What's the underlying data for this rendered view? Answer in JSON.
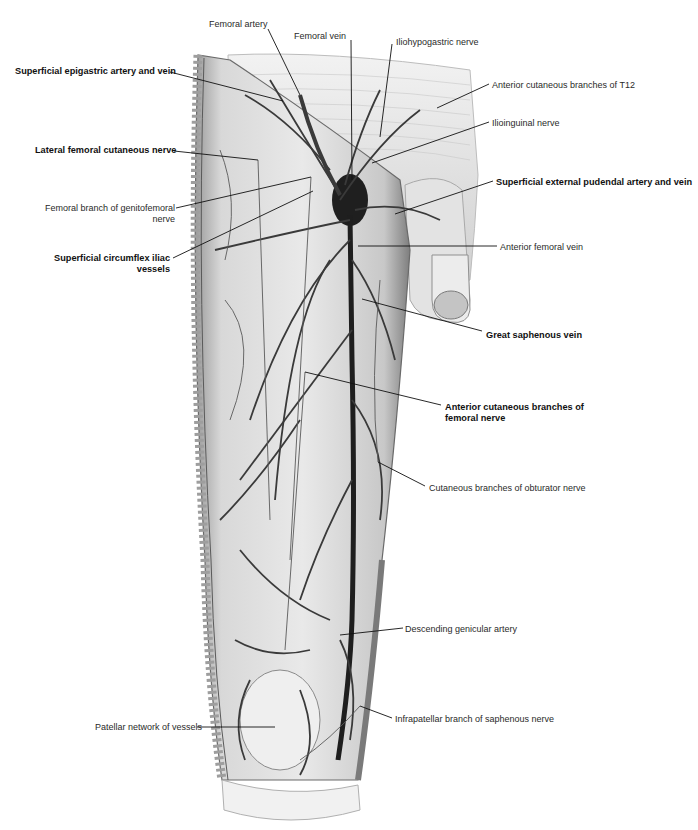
{
  "figure": {
    "colors": {
      "background": "#ffffff",
      "tissue": "#dcdcdc",
      "vessel": "#3a3a3a",
      "vein_dark": "#1e1e1e",
      "leader": "#111111"
    }
  },
  "labels": [
    {
      "id": "femoral-artery",
      "text": "Femoral artery",
      "bold": false,
      "x": 209,
      "y": 19,
      "align": "left",
      "line": [
        [
          268,
          29
        ],
        [
          300,
          95
        ]
      ]
    },
    {
      "id": "femoral-vein",
      "text": "Femoral vein",
      "bold": false,
      "x": 294,
      "y": 31,
      "align": "left",
      "line": [
        [
          351,
          40
        ],
        [
          352,
          180
        ]
      ]
    },
    {
      "id": "iliohypogastric-nerve",
      "text": "Iliohypogastric nerve",
      "bold": false,
      "x": 396,
      "y": 37,
      "align": "left",
      "line": [
        [
          392,
          44
        ],
        [
          380,
          137
        ]
      ]
    },
    {
      "id": "superficial-epigastric",
      "text": "Superficial epigastric artery and vein",
      "bold": true,
      "x": 15,
      "y": 66,
      "align": "left",
      "line": [
        [
          170,
          72
        ],
        [
          283,
          101
        ]
      ]
    },
    {
      "id": "anterior-cutaneous-t12",
      "text": "Anterior cutaneous branches of T12",
      "bold": false,
      "x": 492,
      "y": 80,
      "align": "left",
      "line": [
        [
          489,
          84
        ],
        [
          437,
          108
        ]
      ]
    },
    {
      "id": "ilioinguinal-nerve",
      "text": "Ilioinguinal nerve",
      "bold": false,
      "x": 492,
      "y": 118,
      "align": "left",
      "line": [
        [
          489,
          122
        ],
        [
          372,
          163
        ]
      ]
    },
    {
      "id": "lateral-femoral-cutaneous",
      "text": "Lateral femoral cutaneous nerve",
      "bold": true,
      "x": 35,
      "y": 145,
      "align": "left",
      "line": [
        [
          174,
          151
        ],
        [
          258,
          160
        ]
      ]
    },
    {
      "id": "superficial-external-pudendal",
      "text": "Superficial external pudendal artery and vein",
      "bold": true,
      "x": 496,
      "y": 177,
      "align": "left",
      "line": [
        [
          493,
          181
        ],
        [
          395,
          214
        ]
      ]
    },
    {
      "id": "femoral-branch-genitofemoral",
      "text": "Femoral branch of genitofemoral nerve",
      "bold": false,
      "x": 20,
      "y": 203,
      "align": "right",
      "width": 155,
      "line": [
        [
          176,
          208
        ],
        [
          311,
          177
        ]
      ]
    },
    {
      "id": "anterior-femoral-vein",
      "text": "Anterior femoral vein",
      "bold": false,
      "x": 500,
      "y": 242,
      "align": "left",
      "line": [
        [
          497,
          246
        ],
        [
          358,
          246
        ]
      ]
    },
    {
      "id": "superficial-circumflex-iliac",
      "text": "Superficial circumflex iliac vessels",
      "bold": true,
      "x": 20,
      "y": 253,
      "align": "right",
      "width": 150,
      "line": [
        [
          173,
          258
        ],
        [
          313,
          191
        ]
      ]
    },
    {
      "id": "great-saphenous-vein",
      "text": "Great saphenous vein",
      "bold": true,
      "x": 486,
      "y": 330,
      "align": "left",
      "line": [
        [
          482,
          331
        ],
        [
          362,
          299
        ]
      ]
    },
    {
      "id": "anterior-cutaneous-femoral",
      "text": "Anterior cutaneous branches of femoral nerve",
      "bold": true,
      "x": 445,
      "y": 402,
      "align": "left",
      "width": 140,
      "line": [
        [
          441,
          405
        ],
        [
          305,
          372
        ]
      ]
    },
    {
      "id": "cutaneous-obturator",
      "text": "Cutaneous branches of obturator nerve",
      "bold": false,
      "x": 429,
      "y": 483,
      "align": "left",
      "line": [
        [
          425,
          486
        ],
        [
          378,
          462
        ]
      ]
    },
    {
      "id": "descending-genicular",
      "text": "Descending genicular artery",
      "bold": false,
      "x": 405,
      "y": 624,
      "align": "left",
      "line": [
        [
          403,
          628
        ],
        [
          340,
          635
        ]
      ]
    },
    {
      "id": "patellar-network",
      "text": "Patellar network of vessels",
      "bold": false,
      "x": 95,
      "y": 722,
      "align": "left",
      "line": [
        [
          197,
          727
        ],
        [
          275,
          727
        ]
      ]
    },
    {
      "id": "infrapatellar-saphenous",
      "text": "Infrapatellar branch of saphenous nerve",
      "bold": false,
      "x": 395,
      "y": 714,
      "align": "left",
      "line": [
        [
          392,
          718
        ],
        [
          360,
          706
        ]
      ]
    }
  ]
}
